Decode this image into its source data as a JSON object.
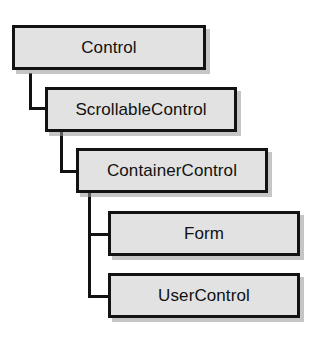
{
  "diagram": {
    "type": "class-hierarchy",
    "background_color": "#ffffff",
    "box_fill_color": "#e2e2e2",
    "box_border_color": "#121212",
    "shadow_color": "#969696",
    "text_color": "#111111",
    "nodes": [
      {
        "id": "control",
        "label": "Control",
        "level": 0
      },
      {
        "id": "scrollablecontrol",
        "label": "ScrollableControl",
        "level": 1
      },
      {
        "id": "containercontrol",
        "label": "ContainerControl",
        "level": 2
      },
      {
        "id": "form",
        "label": "Form",
        "level": 3
      },
      {
        "id": "usercontrol",
        "label": "UserControl",
        "level": 3
      }
    ],
    "edges": [
      {
        "from": "control",
        "to": "scrollablecontrol"
      },
      {
        "from": "scrollablecontrol",
        "to": "containercontrol"
      },
      {
        "from": "containercontrol",
        "to": "form"
      },
      {
        "from": "containercontrol",
        "to": "usercontrol"
      }
    ]
  }
}
